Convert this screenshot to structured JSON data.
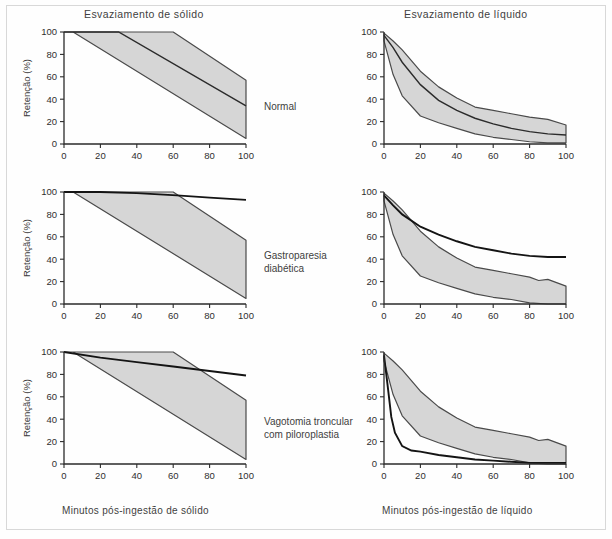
{
  "figure": {
    "column_titles": {
      "solid": "Esvaziamento de sólido",
      "liquid": "Esvaziamento de líquido"
    },
    "axis_captions": {
      "solid": "Minutos pós-ingestão de sólido",
      "liquid": "Minutos pós-ingestão de líquido"
    },
    "row_labels": [
      "Normal",
      "Gastroparesia diabética",
      "Vagotomia troncular com piloroplastia"
    ],
    "colors": {
      "band_fill": "#d6d6d6",
      "band_stroke": "#4a4a4a",
      "curve": "#141414",
      "axis": "#2b2b2b",
      "text": "#3f3f3f",
      "frame": "#d8d8d8",
      "background": "#ffffff"
    }
  },
  "chart_data": [
    {
      "id": "normal-solid",
      "type": "area",
      "title": "Esvaziamento de sólido",
      "row": "Normal",
      "xlabel": "Minutos pós-ingestão de sólido",
      "ylabel": "Retenção (%)",
      "xlim": [
        0,
        100
      ],
      "ylim": [
        0,
        100
      ],
      "xticks": [
        0,
        20,
        40,
        60,
        80,
        100
      ],
      "yticks": [
        0,
        20,
        40,
        60,
        80,
        100
      ],
      "grid": false,
      "legend": "none",
      "series": [
        {
          "name": "Faixa normal — limite superior",
          "role": "band_upper",
          "x": [
            0,
            5,
            60,
            100
          ],
          "values": [
            100,
            100,
            100,
            57
          ]
        },
        {
          "name": "Faixa normal — limite inferior",
          "role": "band_lower",
          "x": [
            0,
            5,
            100
          ],
          "values": [
            100,
            100,
            5
          ]
        },
        {
          "name": "Curva média",
          "role": "midline",
          "x": [
            0,
            30,
            100
          ],
          "values": [
            100,
            100,
            34
          ]
        }
      ]
    },
    {
      "id": "normal-liquid",
      "type": "area",
      "title": "Esvaziamento de líquido",
      "row": "Normal",
      "xlabel": "Minutos pós-ingestão de líquido",
      "ylabel": "",
      "xlim": [
        0,
        100
      ],
      "ylim": [
        0,
        100
      ],
      "xticks": [
        0,
        20,
        40,
        60,
        80,
        100
      ],
      "yticks": [
        0,
        20,
        40,
        60,
        80,
        100
      ],
      "grid": false,
      "legend": "none",
      "series": [
        {
          "name": "Faixa normal — limite superior",
          "role": "band_upper",
          "x": [
            0,
            5,
            10,
            20,
            30,
            40,
            50,
            60,
            70,
            80,
            90,
            100
          ],
          "values": [
            99,
            92,
            84,
            65,
            51,
            41,
            33,
            30,
            27,
            24,
            22,
            17
          ]
        },
        {
          "name": "Faixa normal — limite inferior",
          "role": "band_lower",
          "x": [
            0,
            5,
            10,
            20,
            30,
            40,
            50,
            60,
            70,
            80,
            90,
            100
          ],
          "values": [
            92,
            62,
            43,
            25,
            19,
            14,
            9,
            6,
            4,
            2,
            1,
            1
          ]
        },
        {
          "name": "Curva média",
          "role": "midline",
          "x": [
            0,
            5,
            10,
            20,
            30,
            40,
            50,
            60,
            70,
            80,
            90,
            100
          ],
          "values": [
            97,
            86,
            73,
            53,
            39,
            30,
            23,
            18,
            14,
            11,
            9,
            8
          ]
        }
      ]
    },
    {
      "id": "gastroparesis-solid",
      "type": "area",
      "title": "Esvaziamento de sólido",
      "row": "Gastroparesia diabética",
      "xlabel": "Minutos pós-ingestão de sólido",
      "ylabel": "Retenção (%)",
      "xlim": [
        0,
        100
      ],
      "ylim": [
        0,
        100
      ],
      "xticks": [
        0,
        20,
        40,
        60,
        80,
        100
      ],
      "yticks": [
        0,
        20,
        40,
        60,
        80,
        100
      ],
      "grid": false,
      "legend": "none",
      "series": [
        {
          "name": "Faixa normal — limite superior",
          "role": "band_upper",
          "x": [
            0,
            5,
            60,
            100
          ],
          "values": [
            100,
            100,
            100,
            57
          ]
        },
        {
          "name": "Faixa normal — limite inferior",
          "role": "band_lower",
          "x": [
            0,
            5,
            100
          ],
          "values": [
            100,
            100,
            5
          ]
        },
        {
          "name": "Curva do paciente",
          "role": "patient",
          "x": [
            0,
            20,
            40,
            62,
            80,
            100
          ],
          "values": [
            100,
            100,
            99,
            97,
            95,
            93
          ]
        }
      ]
    },
    {
      "id": "gastroparesis-liquid",
      "type": "area",
      "title": "Esvaziamento de líquido",
      "row": "Gastroparesia diabética",
      "xlabel": "Minutos pós-ingestão de líquido",
      "ylabel": "",
      "xlim": [
        0,
        100
      ],
      "ylim": [
        0,
        100
      ],
      "xticks": [
        0,
        20,
        40,
        60,
        80,
        100
      ],
      "yticks": [
        0,
        20,
        40,
        60,
        80,
        100
      ],
      "grid": false,
      "legend": "none",
      "series": [
        {
          "name": "Faixa normal — limite superior",
          "role": "band_upper",
          "x": [
            0,
            5,
            10,
            20,
            30,
            40,
            50,
            60,
            70,
            80,
            85,
            90,
            100
          ],
          "values": [
            99,
            92,
            84,
            65,
            51,
            41,
            33,
            30,
            27,
            24,
            21,
            22,
            16
          ]
        },
        {
          "name": "Faixa normal — limite inferior",
          "role": "band_lower",
          "x": [
            0,
            5,
            10,
            20,
            30,
            40,
            50,
            60,
            70,
            80,
            90,
            100
          ],
          "values": [
            92,
            62,
            43,
            25,
            19,
            14,
            9,
            6,
            4,
            1,
            0,
            0
          ]
        },
        {
          "name": "Curva do paciente",
          "role": "patient",
          "x": [
            0,
            5,
            10,
            20,
            30,
            40,
            50,
            60,
            70,
            80,
            90,
            100
          ],
          "values": [
            97,
            88,
            80,
            69,
            62,
            56,
            51,
            48,
            45,
            43,
            42,
            42
          ]
        }
      ]
    },
    {
      "id": "vagotomy-solid",
      "type": "area",
      "title": "Esvaziamento de sólido",
      "row": "Vagotomia troncular com piloroplastia",
      "xlabel": "Minutos pós-ingestão de sólido",
      "ylabel": "Retenção (%)",
      "xlim": [
        0,
        100
      ],
      "ylim": [
        0,
        100
      ],
      "xticks": [
        0,
        20,
        40,
        60,
        80,
        100
      ],
      "yticks": [
        0,
        20,
        40,
        60,
        80,
        100
      ],
      "grid": false,
      "legend": "none",
      "series": [
        {
          "name": "Faixa normal — limite superior",
          "role": "band_upper",
          "x": [
            0,
            5,
            60,
            100
          ],
          "values": [
            100,
            100,
            100,
            57
          ]
        },
        {
          "name": "Faixa normal — limite inferior",
          "role": "band_lower",
          "x": [
            0,
            5,
            100
          ],
          "values": [
            100,
            100,
            4
          ]
        },
        {
          "name": "Curva do paciente",
          "role": "patient",
          "x": [
            0,
            20,
            40,
            60,
            80,
            100
          ],
          "values": [
            100,
            95,
            91,
            87,
            83,
            79
          ]
        }
      ]
    },
    {
      "id": "vagotomy-liquid",
      "type": "area",
      "title": "Esvaziamento de líquido",
      "row": "Vagotomia troncular com piloroplastia",
      "xlabel": "Minutos pós-ingestão de líquido",
      "ylabel": "",
      "xlim": [
        0,
        100
      ],
      "ylim": [
        0,
        100
      ],
      "xticks": [
        0,
        20,
        40,
        60,
        80,
        100
      ],
      "yticks": [
        0,
        20,
        40,
        60,
        80,
        100
      ],
      "grid": false,
      "legend": "none",
      "series": [
        {
          "name": "Faixa normal — limite superior",
          "role": "band_upper",
          "x": [
            0,
            5,
            10,
            20,
            30,
            40,
            50,
            60,
            70,
            80,
            85,
            90,
            100
          ],
          "values": [
            99,
            92,
            84,
            65,
            51,
            41,
            33,
            30,
            27,
            24,
            21,
            22,
            16
          ]
        },
        {
          "name": "Faixa normal — limite inferior",
          "role": "band_lower",
          "x": [
            0,
            5,
            10,
            20,
            30,
            40,
            50,
            60,
            70,
            80,
            90,
            100
          ],
          "values": [
            92,
            62,
            43,
            25,
            19,
            14,
            9,
            6,
            4,
            1,
            0,
            0
          ]
        },
        {
          "name": "Curva do paciente",
          "role": "patient",
          "x": [
            0,
            2,
            4,
            6,
            10,
            15,
            20,
            30,
            40,
            50,
            60,
            70,
            80,
            90,
            100
          ],
          "values": [
            97,
            70,
            42,
            28,
            16,
            12,
            11,
            8,
            6,
            4,
            3,
            2,
            1,
            1,
            1
          ]
        }
      ]
    }
  ]
}
